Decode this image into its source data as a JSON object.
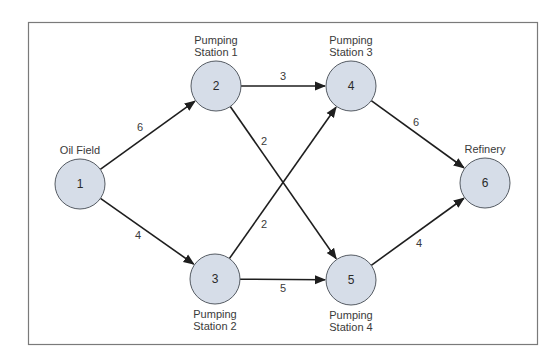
{
  "diagram": {
    "type": "directed-network-flow",
    "nodes": [
      {
        "id": "1",
        "label_lines": [
          "Oil Field"
        ],
        "x": 80,
        "y": 184,
        "label_pos": "above"
      },
      {
        "id": "2",
        "label_lines": [
          "Pumping",
          "Station 1"
        ],
        "x": 216,
        "y": 86,
        "label_pos": "above"
      },
      {
        "id": "3",
        "label_lines": [
          "Pumping",
          "Station 2"
        ],
        "x": 215,
        "y": 279,
        "label_pos": "below"
      },
      {
        "id": "4",
        "label_lines": [
          "Pumping",
          "Station 3"
        ],
        "x": 351,
        "y": 86,
        "label_pos": "above"
      },
      {
        "id": "5",
        "label_lines": [
          "Pumping",
          "Station 4"
        ],
        "x": 351,
        "y": 280,
        "label_pos": "below"
      },
      {
        "id": "6",
        "label_lines": [
          "Refinery"
        ],
        "x": 485,
        "y": 183,
        "label_pos": "above"
      }
    ],
    "edges": [
      {
        "from": "1",
        "to": "2",
        "weight": "6",
        "label_x": 140,
        "label_y": 127
      },
      {
        "from": "1",
        "to": "3",
        "weight": "4",
        "label_x": 138,
        "label_y": 235
      },
      {
        "from": "2",
        "to": "4",
        "weight": "3",
        "label_x": 283,
        "label_y": 76
      },
      {
        "from": "2",
        "to": "5",
        "weight": "2",
        "label_x": 264,
        "label_y": 141
      },
      {
        "from": "3",
        "to": "4",
        "weight": "2",
        "label_x": 264,
        "label_y": 224
      },
      {
        "from": "3",
        "to": "5",
        "weight": "5",
        "label_x": 283,
        "label_y": 288
      },
      {
        "from": "4",
        "to": "6",
        "weight": "6",
        "label_x": 416,
        "label_y": 122
      },
      {
        "from": "5",
        "to": "6",
        "weight": "4",
        "label_x": 419,
        "label_y": 243
      }
    ],
    "colors": {
      "node_fill": "#d6dde8",
      "node_stroke": "#555b63",
      "edge": "#1e1e1e",
      "frame": "#7a7a7a"
    }
  }
}
